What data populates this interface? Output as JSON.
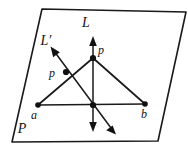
{
  "figure": {
    "kind": "geometry-diagram",
    "colors": {
      "ink": "#1a1a1a",
      "text": "#111111",
      "background": "#ffffff"
    },
    "labels": {
      "plane": "P",
      "line_vertical": "L",
      "line_oblique": "L′",
      "apex_point": "p",
      "interior_point": "p",
      "base_left": "a",
      "base_right": "b"
    },
    "points": {
      "apex_p": {
        "x": 93,
        "y": 58
      },
      "interior_p": {
        "x": 66,
        "y": 72
      },
      "base_a": {
        "x": 38,
        "y": 105
      },
      "base_b": {
        "x": 145,
        "y": 104
      },
      "base_center": {
        "x": 93,
        "y": 105
      }
    },
    "label_positions": {
      "plane": {
        "x": 22,
        "y": 133
      },
      "line_vertical": {
        "x": 86,
        "y": 27
      },
      "line_oblique": {
        "x": 46,
        "y": 45
      },
      "apex_point": {
        "x": 98,
        "y": 54
      },
      "interior_point": {
        "x": 52,
        "y": 76
      },
      "base_left": {
        "x": 34,
        "y": 119
      },
      "base_right": {
        "x": 144,
        "y": 118
      }
    },
    "plane_outline": [
      {
        "x": 42,
        "y": 9
      },
      {
        "x": 186,
        "y": 12
      },
      {
        "x": 158,
        "y": 141
      },
      {
        "x": 12,
        "y": 142
      }
    ],
    "line_L": {
      "name": "L",
      "from": {
        "x": 93,
        "y": 40
      },
      "to": {
        "x": 93,
        "y": 128
      },
      "arrow_up": true,
      "arrow_down": true
    },
    "line_L_prime": {
      "name": "L′",
      "from": {
        "x": 53,
        "y": 50
      },
      "to": {
        "x": 114,
        "y": 132
      },
      "arrow_up": true,
      "arrow_down": true
    },
    "triangle_edges": [
      {
        "name": "apex-to-a",
        "from": {
          "x": 93,
          "y": 58
        },
        "to": {
          "x": 38,
          "y": 105
        }
      },
      {
        "name": "apex-to-b",
        "from": {
          "x": 93,
          "y": 58
        },
        "to": {
          "x": 145,
          "y": 104
        }
      },
      {
        "name": "a-to-b",
        "from": {
          "x": 38,
          "y": 105
        },
        "to": {
          "x": 145,
          "y": 104
        }
      }
    ]
  }
}
